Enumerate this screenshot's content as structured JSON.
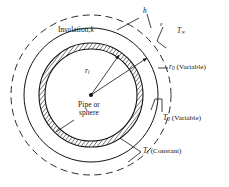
{
  "figure": {
    "name": "insulated-pipe-or-sphere-cross-section"
  },
  "labels": {
    "insulation": {
      "text": "Insulation,",
      "symbol": "k"
    },
    "convection_coeff": {
      "symbol": "h"
    },
    "emissivity": {
      "symbol": "ε"
    },
    "ambient_temp": {
      "symbol": "T",
      "sub": "∞"
    },
    "inner_radius": {
      "symbol": "r",
      "sub": "i"
    },
    "outer_radius": {
      "symbol": "r",
      "sub": "0",
      "note": "(Variable)"
    },
    "outer_temp": {
      "symbol": "T",
      "sub": "0",
      "note": "(Variable)"
    },
    "inner_temp": {
      "symbol": "T",
      "sub": "i",
      "note": "(Constant)"
    },
    "body_line1": "Pipe or",
    "body_line2": "sphere"
  },
  "geometry": {
    "center": {
      "x": 91,
      "y": 95
    },
    "dashed_ambient_radius": 80,
    "solid_outer_radius": 67,
    "pipe_wall_outer_radius": 52,
    "pipe_wall_inner_radius": 46
  },
  "colors": {
    "stroke": "#131313",
    "hatch": "#2a2a2a",
    "background": "#ffffff",
    "text": "#131313"
  }
}
